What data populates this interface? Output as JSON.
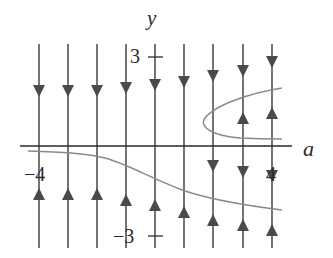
{
  "diagram": {
    "type": "bifurcation-phase-lines",
    "axis_labels": {
      "x": "a",
      "y": "y"
    },
    "tick_labels": {
      "y_top": "3",
      "y_bottom": "−3",
      "x_left": "−4",
      "x_right": "4"
    },
    "colors": {
      "lines": "#3a3a3a",
      "curves": "#8a8a8a",
      "arrows": "#4a4a4a"
    },
    "phase_lines": [
      {
        "x": 39,
        "arrows": [
          {
            "y": 90,
            "dir": "down"
          },
          {
            "y": 195,
            "dir": "up"
          }
        ]
      },
      {
        "x": 68,
        "arrows": [
          {
            "y": 90,
            "dir": "down"
          },
          {
            "y": 195,
            "dir": "up"
          }
        ]
      },
      {
        "x": 97,
        "arrows": [
          {
            "y": 90,
            "dir": "down"
          },
          {
            "y": 195,
            "dir": "up"
          }
        ]
      },
      {
        "x": 126,
        "arrows": [
          {
            "y": 87,
            "dir": "down"
          },
          {
            "y": 201,
            "dir": "up"
          }
        ]
      },
      {
        "x": 155,
        "arrows": [
          {
            "y": 84,
            "dir": "down"
          },
          {
            "y": 206,
            "dir": "up"
          }
        ]
      },
      {
        "x": 184,
        "arrows": [
          {
            "y": 80,
            "dir": "down"
          },
          {
            "y": 214,
            "dir": "up"
          }
        ]
      },
      {
        "x": 213,
        "arrows": [
          {
            "y": 75,
            "dir": "down"
          },
          {
            "y": 165,
            "dir": "down"
          },
          {
            "y": 220,
            "dir": "up"
          }
        ]
      },
      {
        "x": 243,
        "arrows": [
          {
            "y": 70,
            "dir": "down"
          },
          {
            "y": 118,
            "dir": "up"
          },
          {
            "y": 170,
            "dir": "down"
          },
          {
            "y": 225,
            "dir": "up"
          }
        ]
      },
      {
        "x": 272,
        "arrows": [
          {
            "y": 60,
            "dir": "down"
          },
          {
            "y": 113,
            "dir": "up"
          },
          {
            "y": 175,
            "dir": "down"
          },
          {
            "y": 230,
            "dir": "up"
          }
        ]
      }
    ]
  }
}
